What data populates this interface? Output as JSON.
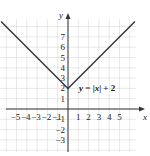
{
  "chart_data": {
    "type": "line",
    "title": "",
    "equation_label": "y = |x| + 2",
    "xlabel": "x",
    "ylabel": "y",
    "x_ticks": [
      -5,
      -4,
      -3,
      -2,
      -1,
      1,
      2,
      3,
      4,
      5
    ],
    "y_ticks": [
      -3,
      -2,
      -1,
      1,
      2,
      3,
      4,
      5,
      6,
      7
    ],
    "xlim": [
      -6.5,
      7
    ],
    "ylim": [
      -4,
      9
    ],
    "grid": true,
    "series": [
      {
        "name": "y = |x| + 2",
        "x": [
          -6.5,
          0,
          6.5
        ],
        "y": [
          8.5,
          2,
          8.5
        ]
      }
    ],
    "vertex": [
      0,
      2
    ]
  },
  "labels": {
    "x_axis": "x",
    "y_axis": "y",
    "equation": {
      "y": "y",
      "eq": " = |",
      "x": "x",
      "rest": "| + 2"
    }
  }
}
